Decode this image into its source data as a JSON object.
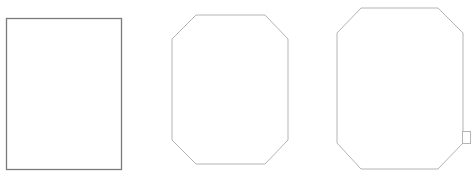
{
  "canvas": {
    "width": 475,
    "height": 190,
    "background": "#ffffff"
  },
  "shapes": [
    {
      "name": "rectangle",
      "type": "rect",
      "x": 6.5,
      "y": 18.5,
      "w": 115,
      "h": 151,
      "stroke": "#7a7a7a",
      "stroke_width": 1.3
    },
    {
      "name": "octagon-small",
      "type": "polygon",
      "points": "196,15 265,15 288,39 288,140 265,164 196,164 172,140 172,39",
      "stroke": "#b4b4b4",
      "stroke_width": 1
    },
    {
      "name": "octagon-large",
      "type": "polygon",
      "points": "361,8 438,8 463,33 463,143 438,169 361,169 337,143 337,33",
      "stroke": "#b4b4b4",
      "stroke_width": 1
    },
    {
      "name": "handle-square",
      "type": "rect",
      "x": 462.5,
      "y": 131.5,
      "w": 8,
      "h": 12,
      "stroke": "#b4b4b4",
      "stroke_width": 1
    }
  ]
}
